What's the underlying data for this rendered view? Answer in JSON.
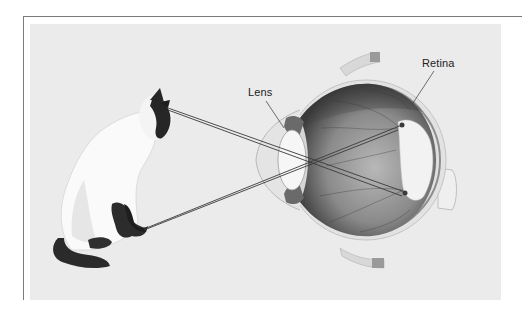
{
  "figure": {
    "type": "anatomical-diagram",
    "labels": {
      "lens": "Lens",
      "retina": "Retina"
    },
    "colors": {
      "background_panel": "#ebebeb",
      "frame_line": "#7a7a7a",
      "ray_line": "#3a3a3a",
      "label_text": "#222222"
    },
    "rays": [
      {
        "from": [
          168,
          108
        ],
        "to": [
          405,
          192
        ]
      },
      {
        "from": [
          168,
          108
        ],
        "to": [
          402,
          196
        ]
      },
      {
        "from": [
          144,
          229
        ],
        "to": [
          402,
          125
        ]
      },
      {
        "from": [
          144,
          229
        ],
        "to": [
          398,
          128
        ]
      }
    ]
  }
}
